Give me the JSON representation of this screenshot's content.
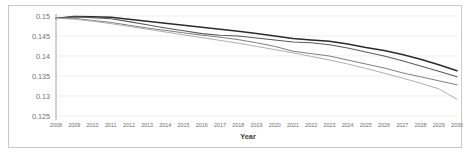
{
  "chart_data": {
    "type": "line",
    "title": "",
    "xlabel": "Year",
    "ylabel": "",
    "grid": true,
    "legend": "none",
    "categories": [
      "2008",
      "2009",
      "2010",
      "2011",
      "2012",
      "2013",
      "2014",
      "2015",
      "2016",
      "2017",
      "2018",
      "2019",
      "2020",
      "2021",
      "2022",
      "2023",
      "2024",
      "2025",
      "2026",
      "2027",
      "2028",
      "2029",
      "2030"
    ],
    "x": [
      2008,
      2009,
      2010,
      2011,
      2012,
      2013,
      2014,
      2015,
      2016,
      2017,
      2018,
      2019,
      2020,
      2021,
      2022,
      2023,
      2024,
      2025,
      2026,
      2027,
      2028,
      2029,
      2030
    ],
    "ylim": [
      0.125,
      0.15
    ],
    "xlim": [
      2008,
      2030
    ],
    "yticks": [
      "0.15",
      "0.145",
      "0.14",
      "0.135",
      "0.13",
      "0.125"
    ],
    "ytick_values": [
      0.15,
      0.145,
      0.14,
      0.135,
      0.13,
      0.125
    ],
    "series": [
      {
        "name": "series-1-darkest",
        "color": "#2b2b2b",
        "width": 1.5,
        "values": [
          0.1494,
          0.1499,
          0.1498,
          0.1497,
          0.1492,
          0.1487,
          0.1482,
          0.1477,
          0.1472,
          0.1467,
          0.1462,
          0.1456,
          0.145,
          0.1444,
          0.144,
          0.1437,
          0.143,
          0.1421,
          0.1414,
          0.1404,
          0.1392,
          0.1378,
          0.1363
        ]
      },
      {
        "name": "series-2-dark-gray",
        "color": "#5a5a5a",
        "width": 1.1,
        "values": [
          0.1494,
          0.1498,
          0.1496,
          0.1493,
          0.1486,
          0.1478,
          0.147,
          0.1463,
          0.1456,
          0.1452,
          0.145,
          0.1445,
          0.144,
          0.1435,
          0.1433,
          0.1428,
          0.142,
          0.141,
          0.14,
          0.1388,
          0.1375,
          0.1362,
          0.1348
        ]
      },
      {
        "name": "series-3-mid-gray",
        "color": "#7f7f7f",
        "width": 1.0,
        "values": [
          0.1494,
          0.1494,
          0.1489,
          0.1484,
          0.1477,
          0.147,
          0.1464,
          0.1458,
          0.1452,
          0.1447,
          0.1441,
          0.1433,
          0.1424,
          0.1412,
          0.1406,
          0.14,
          0.139,
          0.138,
          0.137,
          0.1358,
          0.1348,
          0.1338,
          0.1328
        ]
      },
      {
        "name": "series-4-light-gray",
        "color": "#b0b0b0",
        "width": 1.0,
        "values": [
          0.1494,
          0.1492,
          0.1487,
          0.1481,
          0.1474,
          0.1467,
          0.146,
          0.1453,
          0.1446,
          0.1439,
          0.1432,
          0.1424,
          0.1416,
          0.1408,
          0.1399,
          0.139,
          0.138,
          0.1369,
          0.1357,
          0.1345,
          0.1332,
          0.1318,
          0.1292
        ]
      }
    ]
  }
}
